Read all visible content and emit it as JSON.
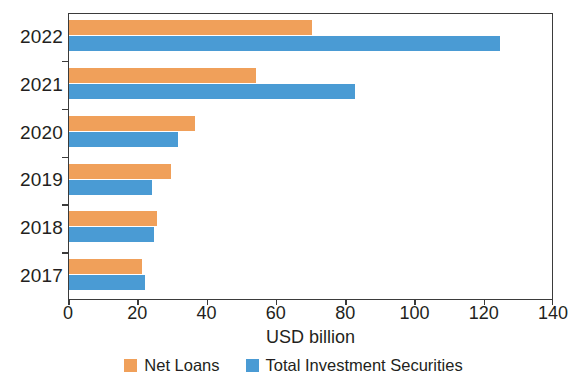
{
  "chart_data": {
    "type": "bar",
    "orientation": "horizontal",
    "title": "",
    "subtitle": "",
    "xlabel": "USD billion",
    "ylabel": "",
    "categories": [
      "2022",
      "2021",
      "2020",
      "2019",
      "2018",
      "2017"
    ],
    "series": [
      {
        "name": "Net Loans",
        "color": "#f0a05a",
        "values": [
          70,
          54,
          36.5,
          29.5,
          25.5,
          21
        ]
      },
      {
        "name": "Total Investment Securities",
        "color": "#4a9bd4",
        "values": [
          124.5,
          82.5,
          31.5,
          24,
          24.5,
          22
        ]
      }
    ],
    "xlim": [
      0,
      140
    ],
    "xticks": [
      0,
      20,
      40,
      60,
      80,
      100,
      120,
      140
    ],
    "xtick_labels": [
      "0",
      "20",
      "40",
      "60",
      "80",
      "100",
      "120",
      "140"
    ],
    "grid": false,
    "legend_position": "bottom",
    "axis_color": "#3b3b3b",
    "background_color": "#ffffff"
  },
  "legend": {
    "items": [
      {
        "label": "Net Loans",
        "color": "#f0a05a"
      },
      {
        "label": "Total Investment Securities",
        "color": "#4a9bd4"
      }
    ]
  }
}
